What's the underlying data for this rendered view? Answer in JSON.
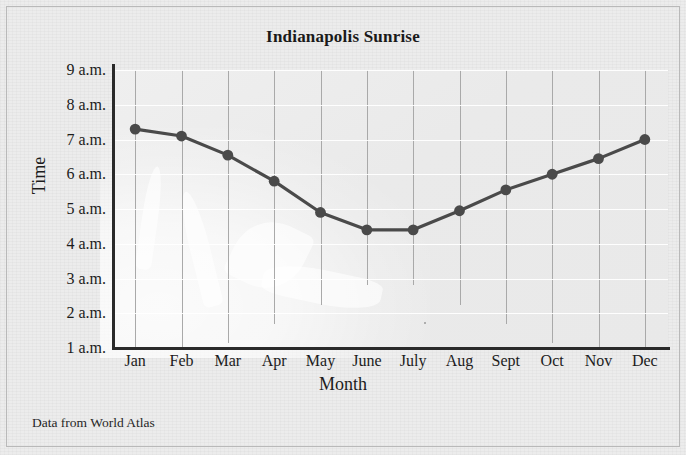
{
  "figure": {
    "title": "Indianapolis Sunrise",
    "source_note": "Data from World Atlas"
  },
  "chart_data": {
    "type": "line",
    "title": "Indianapolis Sunrise",
    "xlabel": "Month",
    "ylabel": "Time",
    "categories": [
      "Jan",
      "Feb",
      "Mar",
      "Apr",
      "May",
      "June",
      "July",
      "Aug",
      "Sept",
      "Oct",
      "Nov",
      "Dec"
    ],
    "values": [
      7.3,
      7.1,
      6.55,
      5.8,
      4.9,
      4.4,
      4.4,
      4.95,
      5.55,
      6.0,
      6.45,
      7.0
    ],
    "value_labels": [
      "7:20 a.m.",
      "7:05 a.m.",
      "6:35 a.m.",
      "5:50 a.m.",
      "4:55 a.m.",
      "4:25 a.m.",
      "4:25 a.m.",
      "5:00 a.m.",
      "5:35 a.m.",
      "6:00 a.m.",
      "6:25 a.m.",
      "7:00 a.m."
    ],
    "ylim": [
      1,
      9
    ],
    "ytick_values": [
      9,
      8,
      7,
      6,
      5,
      4,
      3,
      2,
      1
    ],
    "ytick_labels": [
      "9 a.m.",
      "8 a.m.",
      "7 a.m.",
      "6 a.m.",
      "5 a.m.",
      "4 a.m.",
      "3 a.m.",
      "2 a.m.",
      "1 a.m."
    ],
    "grid": {
      "vertical": true,
      "horizontal": true
    },
    "legend": "none",
    "series_color": "#4a4a4a",
    "marker": "circle"
  }
}
